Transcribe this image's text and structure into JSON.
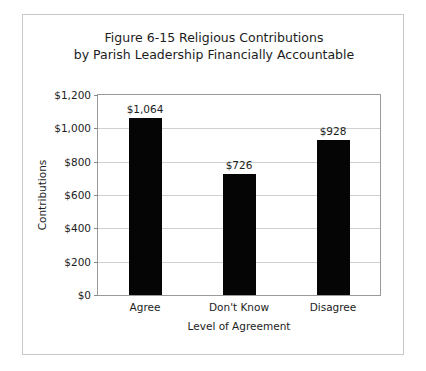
{
  "figure": {
    "title_line_1": "Figure 6-15 Religious Contributions",
    "title_line_2": "by Parish Leadership Financially Accountable",
    "border_color": "#c8c8c8",
    "background_color": "#ffffff"
  },
  "chart_data": {
    "type": "bar",
    "title": "Figure 6-15 Religious Contributions by Parish Leadership Financially Accountable",
    "categories": [
      "Agree",
      "Don't Know",
      "Disagree"
    ],
    "values": [
      1064,
      726,
      928
    ],
    "value_labels": [
      "$1,064",
      "$726",
      "$928"
    ],
    "xlabel": "Level of Agreement",
    "ylabel": "Contributions",
    "ylim": [
      0,
      1200
    ],
    "ytick_values": [
      0,
      200,
      400,
      600,
      800,
      1000,
      1200
    ],
    "ytick_labels": [
      "$0",
      "$200",
      "$400",
      "$600",
      "$800",
      "$1,000",
      "$1,200"
    ],
    "grid": "horizontal",
    "legend": "none",
    "bar_color": "#050505",
    "gridline_color": "#d0d0d0",
    "axis_color": "#9a9a9a"
  }
}
